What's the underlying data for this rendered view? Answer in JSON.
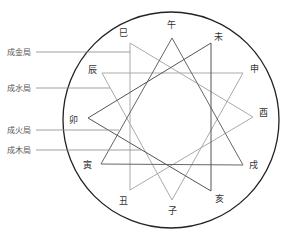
{
  "diagram": {
    "circle": {
      "cx": 171,
      "cy": 120,
      "r": 108,
      "stroke": "#222222"
    },
    "branches": [
      {
        "name": "午",
        "label_x": 171,
        "label_y": 25,
        "vx": 172,
        "vy": 38
      },
      {
        "name": "未",
        "label_x": 218,
        "label_y": 37,
        "vx": 211,
        "vy": 43
      },
      {
        "name": "申",
        "label_x": 254,
        "label_y": 69,
        "vx": 243,
        "vy": 73
      },
      {
        "name": "酉",
        "label_x": 263,
        "label_y": 113,
        "vx": 253,
        "vy": 117
      },
      {
        "name": "戌",
        "label_x": 253,
        "label_y": 165,
        "vx": 243,
        "vy": 165
      },
      {
        "name": "亥",
        "label_x": 219,
        "label_y": 199,
        "vx": 211,
        "vy": 191
      },
      {
        "name": "子",
        "label_x": 172,
        "label_y": 211,
        "vx": 172,
        "vy": 200
      },
      {
        "name": "丑",
        "label_x": 123,
        "label_y": 201,
        "vx": 130,
        "vy": 190
      },
      {
        "name": "寅",
        "label_x": 87,
        "label_y": 165,
        "vx": 101,
        "vy": 164
      },
      {
        "name": "卯",
        "label_x": 73,
        "label_y": 120,
        "vx": 88,
        "vy": 118
      },
      {
        "name": "辰",
        "label_x": 92,
        "label_y": 70,
        "vx": 102,
        "vy": 73
      },
      {
        "name": "巳",
        "label_x": 123,
        "label_y": 33,
        "vx": 130,
        "vy": 43
      }
    ],
    "triangles": [
      {
        "id": "metal",
        "label": "成金局",
        "members": [
          "巳",
          "酉",
          "丑"
        ],
        "points": "130,43 253,117 130,190",
        "color": "#aaaaaa",
        "label_y": 52,
        "line_end_x": 130
      },
      {
        "id": "water",
        "label": "成水局",
        "members": [
          "申",
          "子",
          "辰"
        ],
        "points": "243,73 172,200 102,73",
        "color": "#aaaaaa",
        "label_y": 88,
        "line_end_x": 110
      },
      {
        "id": "fire",
        "label": "成火局",
        "members": [
          "寅",
          "午",
          "戌"
        ],
        "points": "101,164 172,38 243,165",
        "color": "#666666",
        "label_y": 130,
        "line_end_x": 119
      },
      {
        "id": "wood",
        "label": "成木局",
        "members": [
          "亥",
          "卯",
          "未"
        ],
        "points": "211,191 88,118 211,43",
        "color": "#555555",
        "label_y": 150,
        "line_end_x": 141
      }
    ],
    "legend_x": 7,
    "legend_line_start_x": 36,
    "legend_line_color": "#888888"
  }
}
